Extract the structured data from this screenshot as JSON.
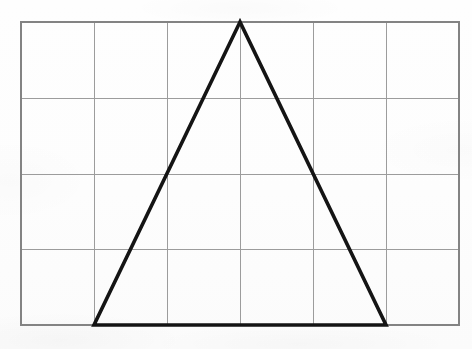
{
  "document": {
    "kind": "scanned-geometry-figure",
    "background_color": "#fdfdfd"
  },
  "figure": {
    "name": "triangle-on-grid",
    "description": "Isosceles triangle drawn on a rectangular grid",
    "grid": {
      "columns": 6,
      "rows": 4,
      "left": 21,
      "top": 22,
      "right": 459,
      "bottom": 325,
      "cell_width": 73,
      "cell_height": 75.75,
      "line_color": "#9c9c9c",
      "line_width": 1,
      "border_color": "#838383",
      "border_width": 2,
      "vertical_lines": [
        94,
        167,
        240,
        313,
        386
      ],
      "horizontal_lines": [
        98,
        174,
        249
      ]
    },
    "shape": {
      "type": "triangle",
      "classification": "isosceles",
      "stroke_color": "#141414",
      "stroke_width": 3.6,
      "fill": "none",
      "vertices": [
        {
          "name": "apex",
          "x": 240,
          "y": 22
        },
        {
          "name": "bottom-left",
          "x": 94,
          "y": 325
        },
        {
          "name": "bottom-right",
          "x": 386,
          "y": 325
        }
      ],
      "points_attr": "240,22 94,325 386,325",
      "base_length_px": 292,
      "height_px": 303,
      "base_length_cells": 4,
      "height_cells": 4
    }
  }
}
